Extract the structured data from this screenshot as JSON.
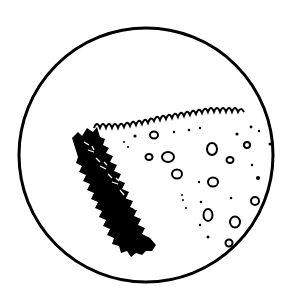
{
  "illustration": {
    "subject": "magnified view of a slice of bread",
    "description": "Circular magnifier frame showing a wedge of bread with porous crumb and a rough dark crust",
    "colors": {
      "ink": "#000000",
      "background": "#ffffff"
    }
  }
}
